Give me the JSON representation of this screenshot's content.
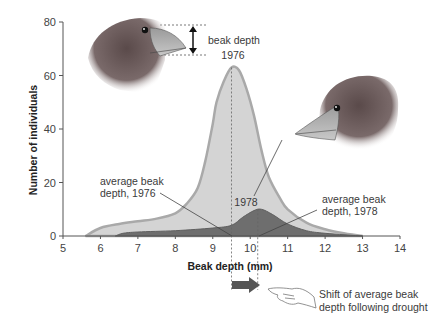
{
  "chart_data": {
    "type": "area",
    "title": "",
    "xlabel": "Beak depth (mm)",
    "ylabel": "Number of individuals",
    "xlim": [
      5,
      14
    ],
    "ylim": [
      0,
      80
    ],
    "x_ticks": [
      5,
      6,
      7,
      8,
      9,
      10,
      11,
      12,
      13,
      14
    ],
    "y_ticks": [
      0,
      20,
      40,
      60,
      80
    ],
    "grid": false,
    "series": [
      {
        "name": "1976",
        "color_fill": "#d4d4d4",
        "color_line": "#a9a9a9",
        "x": [
          5.6,
          6.0,
          6.5,
          7.0,
          7.5,
          8.0,
          8.3,
          8.6,
          8.8,
          9.0,
          9.1,
          9.3,
          9.5,
          9.7,
          9.9,
          10.1,
          10.3,
          10.5,
          10.8,
          11.0,
          11.5,
          12.0,
          12.5,
          13.0
        ],
        "y": [
          0,
          3,
          4.5,
          5.5,
          6.5,
          8.5,
          12,
          18,
          28,
          42,
          50,
          58,
          63,
          62,
          55,
          45,
          32,
          22,
          14,
          10,
          5,
          2.5,
          1,
          0
        ],
        "mean": 9.5,
        "peak": 63
      },
      {
        "name": "1978",
        "color_fill": "#6e6e6e",
        "color_line": "#5a5a5a",
        "x": [
          6.4,
          6.6,
          7.0,
          8.0,
          9.0,
          9.5,
          9.8,
          10.1,
          10.3,
          10.6,
          11.0,
          11.5,
          12.0,
          13.0
        ],
        "y": [
          0,
          1,
          1.5,
          2,
          3,
          4,
          7,
          9.5,
          10,
          8,
          4.5,
          2,
          1,
          0
        ],
        "mean": 10.2,
        "peak": 10
      }
    ],
    "annotations": [
      {
        "text": "beak depth",
        "x": 10,
        "y": 72
      },
      {
        "text": "1976",
        "x": 9.5,
        "y": 67
      },
      {
        "text": "1978",
        "x": 10.2,
        "y": 13
      },
      {
        "text": "average beak depth, 1976",
        "x": 6.5,
        "y": 18
      },
      {
        "text": "average beak depth, 1978",
        "x": 11.7,
        "y": 14
      },
      {
        "text": "Shift of average beak depth following drought",
        "x": 11.8,
        "y": -23
      }
    ]
  },
  "labels": {
    "beak_depth_line1": "beak depth",
    "beak_depth_line2": "1976",
    "label_1978": "1978",
    "avg1976_line1": "average beak",
    "avg1976_line2": "depth, 1976",
    "avg1978_line1": "average beak",
    "avg1978_line2": "depth, 1978",
    "shift_line1": "Shift of average beak",
    "shift_line2": "depth following drought",
    "xlabel": "Beak depth (mm)",
    "ylabel": "Number of individuals"
  },
  "icons": {
    "bird_1976": "finch-head-icon",
    "bird_1978": "finch-head-icon",
    "shift_arrow": "right-arrow-icon",
    "pointing_hand": "pointing-hand-icon"
  }
}
